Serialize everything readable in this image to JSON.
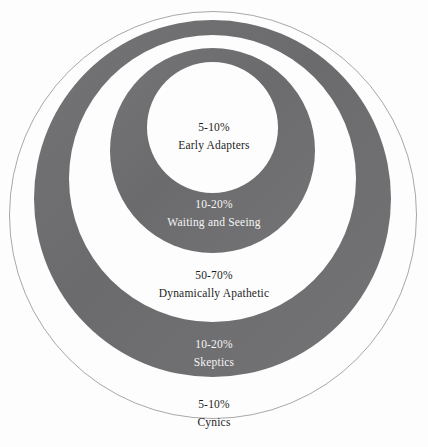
{
  "diagram": {
    "type": "nested-circles",
    "title": "",
    "background_color": "#fdfdfd",
    "band_gray": "#6f6f71",
    "outline_color": "#a8a8a8",
    "dark_text_color": "#1d1d1d",
    "light_text_color": "#f4f4f4",
    "rings": [
      {
        "id": "cynics",
        "percent": "5-10%",
        "name": "Cynics",
        "fill": "white",
        "text_style": "dark"
      },
      {
        "id": "skeptics",
        "percent": "10-20%",
        "name": "Skeptics",
        "fill": "gray",
        "text_style": "light"
      },
      {
        "id": "apathetic",
        "percent": "50-70%",
        "name": "Dynamically Apathetic",
        "fill": "white",
        "text_style": "dark"
      },
      {
        "id": "waiting",
        "percent": "10-20%",
        "name": "Waiting and Seeing",
        "fill": "gray",
        "text_style": "light"
      },
      {
        "id": "early",
        "percent": "5-10%",
        "name": "Early Adapters",
        "fill": "white",
        "text_style": "dark"
      }
    ]
  },
  "chart_data": {
    "type": "pie",
    "title": "",
    "subtitle": "",
    "xlabel": "",
    "ylabel": "",
    "legend_position": "none",
    "grid": false,
    "categories": [
      "Early Adapters",
      "Waiting and Seeing",
      "Dynamically Apathetic",
      "Skeptics",
      "Cynics"
    ],
    "value_labels": [
      "5-10%",
      "10-20%",
      "50-70%",
      "10-20%",
      "5-10%"
    ],
    "values_low": [
      5,
      10,
      50,
      10,
      5
    ],
    "values_high": [
      10,
      20,
      70,
      20,
      10
    ],
    "units": "percent"
  }
}
